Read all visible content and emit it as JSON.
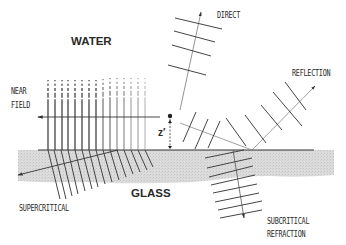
{
  "labels": {
    "water": "WATER",
    "glass": "GLASS",
    "near_field_line1": "NEAR",
    "near_field_line2": "FIELD",
    "direct": "DIRECT",
    "reflection": "REFLECTION",
    "supercritical": "SUPERCRITICAL",
    "subcritical_line1": "SUBCRITICAL",
    "subcritical_line2": "REFRACTION",
    "distance": "z′"
  },
  "colors": {
    "line": "#3a3a3a",
    "light_line": "#8a8a8a",
    "glass_fill": "#d9d9d9",
    "background": "#ffffff"
  },
  "regions": [
    {
      "name": "water",
      "position": "above interface"
    },
    {
      "name": "glass",
      "position": "below interface"
    }
  ],
  "waves": [
    {
      "name": "direct",
      "direction": "up-right from emitter"
    },
    {
      "name": "reflection",
      "direction": "up-right from interface"
    },
    {
      "name": "subcritical-refraction",
      "direction": "down into glass"
    },
    {
      "name": "supercritical",
      "direction": "down-left into glass"
    },
    {
      "name": "near-field",
      "direction": "evanescent, left along interface"
    }
  ]
}
